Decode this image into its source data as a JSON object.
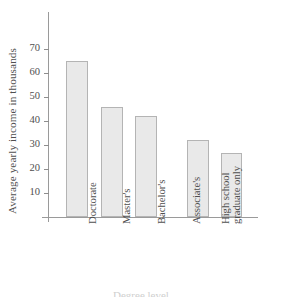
{
  "chart_data": {
    "type": "bar",
    "title": "",
    "xlabel": "Degree level",
    "ylabel": "Average yearly income in thousands",
    "categories": [
      "Doctorate",
      "Master's",
      "Bachelor's",
      "Associate's",
      "High school graduate only"
    ],
    "category_lines": [
      [
        "Doctorate"
      ],
      [
        "Master's"
      ],
      [
        "Bachelor's"
      ],
      [
        "Associate's"
      ],
      [
        "High school",
        "graduate only"
      ]
    ],
    "values": [
      65,
      45.7,
      42,
      32,
      26.5
    ],
    "ylim": [
      0,
      78
    ],
    "yticks": [
      10,
      20,
      30,
      40,
      50,
      60,
      70
    ],
    "ytick_labels": [
      "10",
      "20",
      "30",
      "40",
      "50",
      "60",
      "70"
    ],
    "grid": false,
    "legend": false,
    "colors": {
      "bar_fill": "#e9e9e9",
      "bar_border": "#b4b4b4",
      "axis": "#9a9a9a",
      "text": "#4f4f4f",
      "background": "#ffffff"
    }
  }
}
